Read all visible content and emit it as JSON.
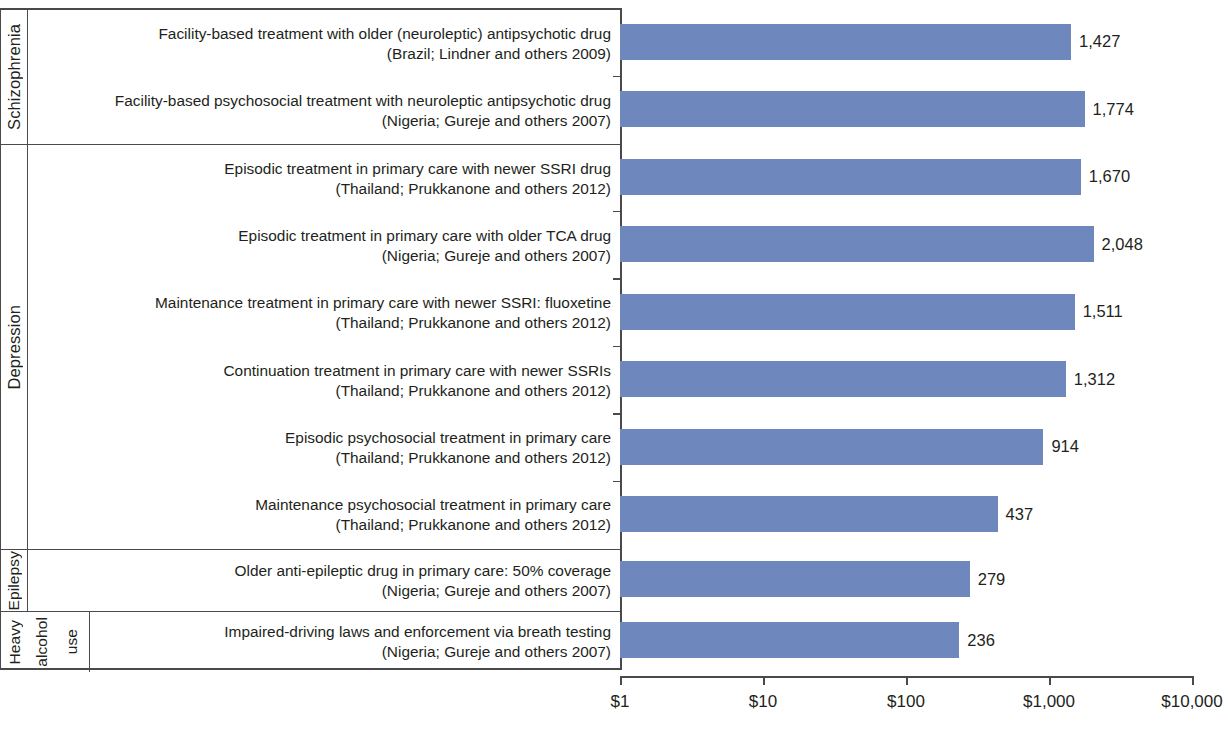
{
  "chart_data": {
    "type": "bar",
    "orientation": "horizontal",
    "title": "",
    "xlabel": "",
    "ylabel": "",
    "xscale": "log",
    "xlim": [
      1,
      10000
    ],
    "xticks": [
      "$1",
      "$10",
      "$100",
      "$1,000",
      "$10,000"
    ],
    "xtick_values": [
      1,
      10,
      100,
      1000,
      10000
    ],
    "grid": false,
    "legend": "none",
    "bar_color": "#6e88bd",
    "axis_color": "#4a4a4a",
    "text_color": "#231f20",
    "categories": [
      "Schizophrenia",
      "Depression",
      "Epilepsy",
      "Heavy alcohol use"
    ],
    "items": [
      {
        "group": "Schizophrenia",
        "label": "Facility-based treatment with older (neuroleptic) antipsychotic drug\n(Brazil; Lindner and others 2009)",
        "value": 1427,
        "value_label": "1,427"
      },
      {
        "group": "Schizophrenia",
        "label": "Facility-based psychosocial treatment with neuroleptic antipsychotic drug\n(Nigeria; Gureje and others 2007)",
        "value": 1774,
        "value_label": "1,774"
      },
      {
        "group": "Depression",
        "label": "Episodic treatment in primary care with newer SSRI drug\n(Thailand; Prukkanone and others 2012)",
        "value": 1670,
        "value_label": "1,670"
      },
      {
        "group": "Depression",
        "label": "Episodic treatment in primary care with older TCA drug\n(Nigeria; Gureje and others 2007)",
        "value": 2048,
        "value_label": "2,048"
      },
      {
        "group": "Depression",
        "label": "Maintenance treatment in primary care with newer SSRI: fluoxetine\n(Thailand; Prukkanone and others 2012)",
        "value": 1511,
        "value_label": "1,511"
      },
      {
        "group": "Depression",
        "label": "Continuation treatment in primary care with newer SSRIs\n(Thailand; Prukkanone and others 2012)",
        "value": 1312,
        "value_label": "1,312"
      },
      {
        "group": "Depression",
        "label": "Episodic psychosocial treatment in primary care\n(Thailand; Prukkanone and others 2012)",
        "value": 914,
        "value_label": "914"
      },
      {
        "group": "Depression",
        "label": "Maintenance psychosocial treatment in primary care\n(Thailand; Prukkanone and others 2012)",
        "value": 437,
        "value_label": "437"
      },
      {
        "group": "Epilepsy",
        "label": "Older anti-epileptic drug in primary care: 50% coverage\n(Nigeria; Gureje and others 2007)",
        "value": 279,
        "value_label": "279"
      },
      {
        "group": "Heavy alcohol use",
        "label": "Impaired-driving laws and enforcement via breath testing\n(Nigeria; Gureje and others 2007)",
        "value": 236,
        "value_label": "236"
      }
    ]
  },
  "groups": [
    {
      "name": "Schizophrenia",
      "rotated_lines": [
        "Schizophrenia"
      ],
      "row_indices": [
        0,
        1
      ]
    },
    {
      "name": "Depression",
      "rotated_lines": [
        "Depression"
      ],
      "row_indices": [
        2,
        3,
        4,
        5,
        6,
        7
      ]
    },
    {
      "name": "Epilepsy",
      "rotated_lines": [
        "Epilepsy"
      ],
      "row_indices": [
        8
      ]
    },
    {
      "name": "Heavy alcohol use",
      "rotated_lines": [
        "Heavy",
        "alcohol",
        "use"
      ],
      "row_indices": [
        9
      ]
    }
  ]
}
